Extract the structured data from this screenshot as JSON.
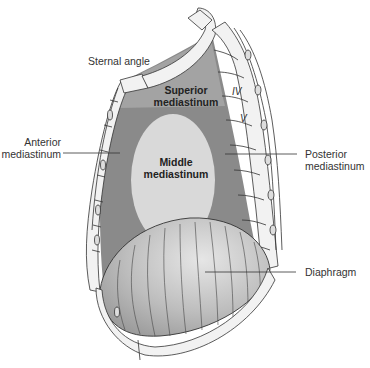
{
  "figure": {
    "type": "anatomy-diagram"
  },
  "regions": {
    "superior": {
      "label_line1": "Superior",
      "label_line2": "mediastinum",
      "color": "#a3a3a3"
    },
    "middle": {
      "label_line1": "Middle",
      "label_line2": "mediastinum",
      "color": "#d9d9d9"
    },
    "anterior_posterior_fill": "#8a8a8a",
    "diaphragm_fill": "#c8c8c8",
    "bone_fill": "#f2f2f2",
    "outline": "#333333"
  },
  "labels": {
    "sternal_angle": "Sternal angle",
    "anterior_line1": "Anterior",
    "anterior_line2": "mediastinum",
    "posterior_line1": "Posterior",
    "posterior_line2": "mediastinum",
    "diaphragm": "Diaphragm"
  },
  "vertebrae": {
    "iv": "IV",
    "v": "V"
  }
}
